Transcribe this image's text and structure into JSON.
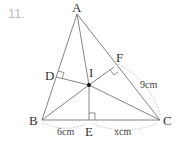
{
  "problem_number": "11.",
  "points": {
    "A": "A",
    "B": "B",
    "C": "C",
    "D": "D",
    "E": "E",
    "F": "F",
    "I": "I"
  },
  "measurements": {
    "BE": "6cm",
    "EC": "xcm",
    "FC": "9cm"
  }
}
